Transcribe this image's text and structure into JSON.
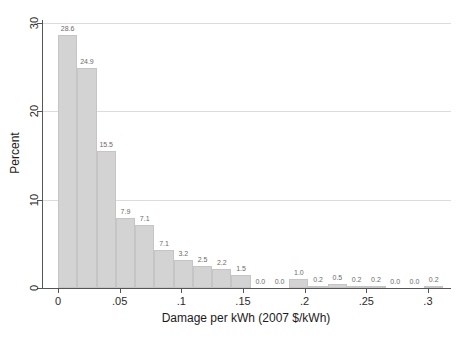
{
  "chart_data": {
    "type": "bar",
    "subtype": "histogram",
    "title": "",
    "xlabel": "Damage per kWh (2007 $/kWh)",
    "ylabel": "Percent",
    "bin_start": 0,
    "bin_width": 0.015625,
    "values": [
      28.6,
      24.9,
      15.5,
      7.9,
      7.1,
      4.3,
      3.2,
      2.5,
      2.2,
      1.5,
      0.0,
      0.0,
      1.0,
      0.2,
      0.5,
      0.2,
      0.2,
      0.0,
      0.0,
      0.2
    ],
    "bar_labels": [
      "28.6",
      "24.9",
      "15.5",
      "7.9",
      "7.1",
      "7.1",
      "3.2",
      "2.5",
      "2.2",
      "1.5",
      "0.0",
      "0.0",
      "1.0",
      "0.2",
      "0.5",
      "0.2",
      "0.2",
      "0.0",
      "0.0",
      "0.2"
    ],
    "x_ticks": [
      {
        "value": 0,
        "label": "0"
      },
      {
        "value": 0.05,
        "label": ".05"
      },
      {
        "value": 0.1,
        "label": ".1"
      },
      {
        "value": 0.15,
        "label": ".15"
      },
      {
        "value": 0.2,
        "label": ".2"
      },
      {
        "value": 0.25,
        "label": ".25"
      },
      {
        "value": 0.3,
        "label": ".3"
      }
    ],
    "y_ticks": [
      {
        "value": 0,
        "label": "0"
      },
      {
        "value": 10,
        "label": "10"
      },
      {
        "value": 20,
        "label": "20"
      },
      {
        "value": 30,
        "label": "30"
      }
    ],
    "xlim": [
      -0.0122,
      0.3187
    ],
    "ylim": [
      0,
      30.34
    ],
    "grid": "horizontal",
    "legend": "none",
    "colors": {
      "bar_fill": "#d3d3d3",
      "bar_edge": "#c5c5c5",
      "gridline": "#dcdcdc",
      "axis_line": "#555555",
      "tick_text": "#2b2b2b",
      "bar_label_text": "#6b6b6b",
      "title_text": "#1a1a1a",
      "background": "#ffffff"
    }
  }
}
